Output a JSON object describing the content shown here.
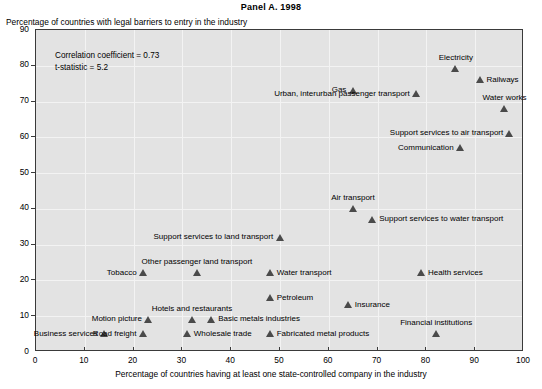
{
  "panel": {
    "title": "Panel A. 1998"
  },
  "axes": {
    "ylabel": "Percentage of countries with legal barriers to entry in the industry",
    "xlabel": "Percentage of countries having at least one state-controlled company in the industry",
    "yticks": [
      "0",
      "10",
      "20",
      "30",
      "40",
      "50",
      "60",
      "70",
      "80",
      "90"
    ],
    "xticks": [
      "0",
      "10",
      "20",
      "30",
      "40",
      "50",
      "60",
      "70",
      "80",
      "90",
      "100"
    ]
  },
  "stats": {
    "correlation_line": "Correlation coefficient = 0.73",
    "tstat_line": "t-statistic = 5.2"
  },
  "chart_data": {
    "type": "scatter",
    "title": "Panel A. 1998",
    "xlabel": "Percentage of countries having at least one state-controlled company in the industry",
    "ylabel": "Percentage of countries with legal barriers to entry in the industry",
    "xlim": [
      0,
      100
    ],
    "ylim": [
      0,
      90
    ],
    "xticks": [
      0,
      10,
      20,
      30,
      40,
      50,
      60,
      70,
      80,
      90,
      100
    ],
    "yticks": [
      0,
      10,
      20,
      30,
      40,
      50,
      60,
      70,
      80,
      90
    ],
    "grid": true,
    "legend": "none",
    "marker": "triangle",
    "marker_color": "#4a4a4a",
    "annotations": [
      "Correlation coefficient = 0.73",
      "t-statistic = 5.2"
    ],
    "points": [
      {
        "label": "Electricity",
        "x": 86,
        "y": 79,
        "pos": "above"
      },
      {
        "label": "Railways",
        "x": 91,
        "y": 76,
        "pos": "right"
      },
      {
        "label": "Water works",
        "x": 96,
        "y": 68,
        "pos": "above"
      },
      {
        "label": "Gas",
        "x": 65,
        "y": 73,
        "pos": "left"
      },
      {
        "label": "Urban, interurban passenger transport",
        "x": 78,
        "y": 72,
        "pos": "left"
      },
      {
        "label": "Support services to air transport",
        "x": 97,
        "y": 61,
        "pos": "left"
      },
      {
        "label": "Communication",
        "x": 87,
        "y": 57,
        "pos": "left"
      },
      {
        "label": "Air transport",
        "x": 65,
        "y": 40,
        "pos": "above"
      },
      {
        "label": "Support services to water transport",
        "x": 69,
        "y": 37,
        "pos": "right"
      },
      {
        "label": "Support services to land transport",
        "x": 50,
        "y": 32,
        "pos": "left"
      },
      {
        "label": "Other passenger land transport",
        "x": 33,
        "y": 22,
        "pos": "above"
      },
      {
        "label": "Tobacco",
        "x": 22,
        "y": 22,
        "pos": "left"
      },
      {
        "label": "Water transport",
        "x": 48,
        "y": 22,
        "pos": "right"
      },
      {
        "label": "Health services",
        "x": 79,
        "y": 22,
        "pos": "right"
      },
      {
        "label": "Petroleum",
        "x": 48,
        "y": 15,
        "pos": "right"
      },
      {
        "label": "Insurance",
        "x": 64,
        "y": 13,
        "pos": "right"
      },
      {
        "label": "Hotels and restaurants",
        "x": 32,
        "y": 9,
        "pos": "above"
      },
      {
        "label": "Basic metals industries",
        "x": 36,
        "y": 9,
        "pos": "right"
      },
      {
        "label": "Motion picture",
        "x": 23,
        "y": 9,
        "pos": "left"
      },
      {
        "label": "Business services",
        "x": 14,
        "y": 5,
        "pos": "left"
      },
      {
        "label": "Road freight",
        "x": 22,
        "y": 5,
        "pos": "left"
      },
      {
        "label": "Wholesale trade",
        "x": 31,
        "y": 5,
        "pos": "right"
      },
      {
        "label": "Fabricated metal products",
        "x": 48,
        "y": 5,
        "pos": "right"
      },
      {
        "label": "Financial institutions",
        "x": 82,
        "y": 5,
        "pos": "above"
      }
    ]
  }
}
